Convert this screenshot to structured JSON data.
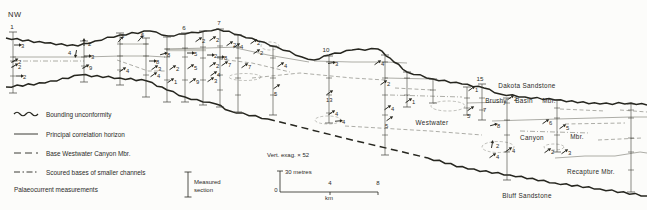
{
  "region_label": "NW",
  "colors": {
    "ink": "#26261f",
    "thin_line": "#6b6b62",
    "paper": "#fcfcfa"
  },
  "legend": {
    "items": [
      {
        "style": "wavy",
        "label": "Bounding unconformity"
      },
      {
        "style": "solid",
        "label": "Principal correlation horizon"
      },
      {
        "style": "dashed",
        "label": "Base Westwater Canyon Mbr."
      },
      {
        "style": "dashdot",
        "label": "Scoured bases of smaller channels"
      }
    ],
    "palaeocurrent_label": "Palaeocurrent measurements"
  },
  "scalebar": {
    "vert_exag": "Vert. exag. × 52",
    "vertical_label": "30 metres",
    "ticks": [
      "0",
      "4",
      "8"
    ],
    "unit": "km",
    "measured_section_line1": "Measured",
    "measured_section_line2": "section"
  },
  "strat_labels": [
    {
      "text": "Dakota Sandstone",
      "x": 527,
      "y": 88
    },
    {
      "text": "Brushy",
      "x": 496,
      "y": 103
    },
    {
      "text": "Basin",
      "x": 524,
      "y": 103
    },
    {
      "text": "Mbr.",
      "x": 549,
      "y": 103
    },
    {
      "text": "Westwater",
      "x": 432,
      "y": 125
    },
    {
      "text": "Canyon",
      "x": 532,
      "y": 140
    },
    {
      "text": "Mbr.",
      "x": 577,
      "y": 139
    },
    {
      "text": "Recapture Mbr.",
      "x": 591,
      "y": 174
    },
    {
      "text": "Bluff Sandstone",
      "x": 527,
      "y": 198
    }
  ],
  "section_numbers": [
    {
      "n": "1",
      "x": 12,
      "y": 29
    },
    {
      "n": "6",
      "x": 184,
      "y": 30
    },
    {
      "n": "7",
      "x": 219,
      "y": 25
    },
    {
      "n": "10",
      "x": 326,
      "y": 52
    },
    {
      "n": "15",
      "x": 480,
      "y": 81
    }
  ],
  "sections": [
    [
      13,
      32,
      93,
      [
        57,
        61,
        76
      ]
    ],
    [
      84,
      41,
      82,
      [
        57,
        66
      ]
    ],
    [
      120,
      33,
      85,
      [
        44,
        56,
        70
      ]
    ],
    [
      146,
      38,
      97,
      [
        44,
        56,
        75
      ]
    ],
    [
      167,
      37,
      102,
      [
        49,
        57,
        80
      ]
    ],
    [
      185,
      33,
      102,
      [
        48,
        57,
        80
      ]
    ],
    [
      203,
      31,
      105,
      [
        47,
        58,
        80
      ]
    ],
    [
      220,
      29,
      107,
      [
        46,
        58,
        75,
        90
      ]
    ],
    [
      238,
      35,
      112,
      [
        47,
        58,
        78,
        95
      ]
    ],
    [
      273,
      46,
      115,
      [
        58,
        78,
        95
      ]
    ],
    [
      329,
      56,
      123,
      [
        62,
        78,
        95,
        113
      ]
    ],
    [
      385,
      55,
      155,
      [
        62,
        78,
        95,
        115,
        135
      ]
    ],
    [
      407,
      72,
      107,
      [
        78,
        95
      ]
    ],
    [
      433,
      79,
      103,
      [
        90
      ]
    ],
    [
      467,
      87,
      115,
      [
        98,
        108
      ]
    ],
    [
      482,
      84,
      120,
      [
        98,
        110
      ]
    ],
    [
      507,
      98,
      180,
      [
        103,
        120,
        135,
        152
      ]
    ],
    [
      557,
      100,
      152,
      [
        108,
        118,
        135
      ]
    ],
    [
      631,
      104,
      192,
      [
        110,
        118,
        138,
        152,
        170
      ]
    ]
  ],
  "palaeocurrents": [
    {
      "x": 17,
      "y": 45,
      "v": "3",
      "a": 0
    },
    {
      "x": 14,
      "y": 61,
      "v": "2",
      "a": -30
    },
    {
      "x": 14,
      "y": 66,
      "v": "2",
      "a": -30
    },
    {
      "x": 19,
      "y": 76,
      "v": "2",
      "a": 0
    },
    {
      "x": 84,
      "y": 43,
      "v": "2",
      "a": -90
    },
    {
      "x": 76,
      "y": 53,
      "v": "4",
      "a": 100,
      "lx": -8,
      "ly": 2
    },
    {
      "x": 87,
      "y": 56,
      "v": "3",
      "a": 0
    },
    {
      "x": 85,
      "y": 67,
      "v": "9",
      "a": -30
    },
    {
      "x": 120,
      "y": 40,
      "v": "5",
      "a": -50,
      "lx": 1,
      "ly": -2
    },
    {
      "x": 122,
      "y": 70,
      "v": "4",
      "a": -35
    },
    {
      "x": 140,
      "y": 39,
      "v": "6",
      "a": -50,
      "lx": 1,
      "ly": -2
    },
    {
      "x": 152,
      "y": 61,
      "v": "8",
      "a": 0
    },
    {
      "x": 154,
      "y": 68,
      "v": "3",
      "a": -35
    },
    {
      "x": 153,
      "y": 75,
      "v": "4",
      "a": -35
    },
    {
      "x": 163,
      "y": 54,
      "v": "8",
      "a": -15
    },
    {
      "x": 172,
      "y": 68,
      "v": "2",
      "a": -35
    },
    {
      "x": 170,
      "y": 81,
      "v": "1",
      "a": -35
    },
    {
      "x": 190,
      "y": 53,
      "v": "5",
      "a": 0
    },
    {
      "x": 190,
      "y": 67,
      "v": "5",
      "a": -35
    },
    {
      "x": 192,
      "y": 81,
      "v": "9",
      "a": -35
    },
    {
      "x": 198,
      "y": 40,
      "v": "2",
      "a": -35
    },
    {
      "x": 212,
      "y": 39,
      "v": "2",
      "a": -35
    },
    {
      "x": 229,
      "y": 44,
      "v": "2",
      "a": -35
    },
    {
      "x": 236,
      "y": 46,
      "v": "4",
      "a": -35
    },
    {
      "x": 210,
      "y": 55,
      "v": "2",
      "a": 0
    },
    {
      "x": 220,
      "y": 57,
      "v": "8",
      "a": 0
    },
    {
      "x": 212,
      "y": 65,
      "v": "2",
      "a": -35
    },
    {
      "x": 224,
      "y": 64,
      "v": "7",
      "a": -35
    },
    {
      "x": 244,
      "y": 66,
      "v": "7",
      "a": -35
    },
    {
      "x": 213,
      "y": 74,
      "v": "4",
      "a": -35
    },
    {
      "x": 210,
      "y": 80,
      "v": "3",
      "a": -35
    },
    {
      "x": 253,
      "y": 42,
      "v": "2",
      "a": -35
    },
    {
      "x": 256,
      "y": 52,
      "v": "2",
      "a": -35
    },
    {
      "x": 280,
      "y": 65,
      "v": "4",
      "a": -35
    },
    {
      "x": 276,
      "y": 87,
      "v": "5",
      "a": -35,
      "lx": -2,
      "ly": 9
    },
    {
      "x": 331,
      "y": 63,
      "v": "3",
      "a": -10
    },
    {
      "x": 329,
      "y": 93,
      "v": "13",
      "a": -35,
      "lx": -3,
      "ly": 9
    },
    {
      "x": 331,
      "y": 113,
      "v": "4",
      "a": -35
    },
    {
      "x": 338,
      "y": 121,
      "v": "4",
      "a": -5
    },
    {
      "x": 377,
      "y": 63,
      "v": "4",
      "a": -35
    },
    {
      "x": 383,
      "y": 83,
      "v": "2",
      "a": -35
    },
    {
      "x": 387,
      "y": 108,
      "v": "4",
      "a": -35
    },
    {
      "x": 389,
      "y": 119,
      "v": "5",
      "a": -35,
      "lx": -4,
      "ly": 9
    },
    {
      "x": 408,
      "y": 101,
      "v": "1",
      "a": -35
    },
    {
      "x": 471,
      "y": 89,
      "v": "1",
      "a": -35
    },
    {
      "x": 470,
      "y": 109,
      "v": "5",
      "a": -35,
      "lx": -3,
      "ly": 9
    },
    {
      "x": 483,
      "y": 110,
      "v": "7",
      "a": null,
      "lx": 0,
      "ly": 2
    },
    {
      "x": 510,
      "y": 98,
      "v": "2",
      "a": -35
    },
    {
      "x": 493,
      "y": 125,
      "v": "8",
      "a": -15
    },
    {
      "x": 492,
      "y": 145,
      "v": "2",
      "a": -80
    },
    {
      "x": 508,
      "y": 150,
      "v": "4",
      "a": -35
    },
    {
      "x": 492,
      "y": 156,
      "v": "4",
      "a": -35
    },
    {
      "x": 545,
      "y": 122,
      "v": "6",
      "a": -35
    },
    {
      "x": 562,
      "y": 127,
      "v": "5",
      "a": -35
    },
    {
      "x": 547,
      "y": 151,
      "v": "2",
      "a": -35
    },
    {
      "x": 564,
      "y": 152,
      "v": "3",
      "a": -35
    }
  ],
  "lines": {
    "bold_wavy": [
      [
        [
          6,
          38
        ],
        [
          45,
          43
        ],
        [
          78,
          46
        ],
        [
          95,
          41
        ],
        [
          120,
          35
        ],
        [
          150,
          31
        ],
        [
          168,
          36
        ],
        [
          185,
          34
        ],
        [
          205,
          31
        ],
        [
          218,
          29
        ],
        [
          240,
          35
        ],
        [
          258,
          41
        ],
        [
          277,
          47
        ],
        [
          302,
          57
        ],
        [
          314,
          60
        ],
        [
          329,
          55
        ],
        [
          352,
          50
        ],
        [
          378,
          49
        ],
        [
          390,
          58
        ],
        [
          407,
          72
        ],
        [
          433,
          79
        ],
        [
          462,
          84
        ],
        [
          484,
          88
        ],
        [
          500,
          94
        ],
        [
          525,
          97
        ],
        [
          555,
          100
        ],
        [
          600,
          104
        ],
        [
          631,
          103
        ],
        [
          647,
          105
        ]
      ],
      [
        [
          6,
          87
        ],
        [
          45,
          83
        ],
        [
          80,
          75
        ],
        [
          120,
          78
        ],
        [
          147,
          81
        ],
        [
          167,
          90
        ],
        [
          185,
          97
        ],
        [
          203,
          102
        ],
        [
          216,
          104
        ],
        [
          230,
          111
        ],
        [
          268,
          119
        ]
      ],
      [
        [
          428,
          158
        ],
        [
          468,
          169
        ],
        [
          510,
          175
        ],
        [
          555,
          183
        ],
        [
          600,
          189
        ],
        [
          647,
          196
        ]
      ]
    ],
    "bold_dashed": [
      [
        [
          268,
          119
        ],
        [
          348,
          139
        ],
        [
          428,
          158
        ]
      ]
    ],
    "thin_solid": [
      [
        [
          13,
          57
        ],
        [
          84,
          57
        ],
        [
          120,
          56
        ],
        [
          148,
          56
        ],
        [
          165,
          57
        ]
      ],
      [
        [
          120,
          44
        ],
        [
          148,
          44
        ]
      ],
      [
        [
          165,
          49
        ],
        [
          207,
          48
        ],
        [
          240,
          47
        ]
      ],
      [
        [
          236,
          48
        ],
        [
          268,
          55
        ],
        [
          309,
          62
        ]
      ],
      [
        [
          314,
          61
        ],
        [
          352,
          62
        ],
        [
          385,
          62
        ],
        [
          407,
          63
        ]
      ],
      [
        [
          385,
          78
        ],
        [
          433,
          79
        ]
      ],
      [
        [
          467,
          103
        ],
        [
          507,
          102
        ]
      ],
      [
        [
          492,
          121
        ],
        [
          557,
          119
        ],
        [
          631,
          117
        ],
        [
          647,
          117
        ]
      ],
      [
        [
          555,
          158
        ],
        [
          585,
          156
        ],
        [
          615,
          156
        ],
        [
          640,
          152
        ],
        [
          647,
          153
        ]
      ]
    ],
    "thin_dashed": [
      [
        [
          117,
          60
        ],
        [
          148,
          71
        ],
        [
          167,
          71
        ]
      ],
      [
        [
          219,
          59
        ],
        [
          252,
          63
        ],
        [
          290,
          72
        ]
      ],
      [
        [
          252,
          78
        ],
        [
          300,
          73
        ],
        [
          352,
          78
        ],
        [
          385,
          80
        ]
      ],
      [
        [
          395,
          88
        ],
        [
          432,
          90
        ]
      ],
      [
        [
          345,
          126
        ],
        [
          430,
          131
        ],
        [
          482,
          135
        ]
      ],
      [
        [
          560,
          109
        ],
        [
          605,
          111
        ]
      ],
      [
        [
          620,
          110
        ],
        [
          647,
          112
        ]
      ],
      [
        [
          565,
          124
        ],
        [
          625,
          123
        ]
      ],
      [
        [
          598,
          140
        ],
        [
          642,
          138
        ]
      ]
    ],
    "thin_dashdot": [
      [
        [
          13,
          61
        ],
        [
          84,
          61
        ]
      ],
      [
        [
          390,
          95
        ],
        [
          462,
          97
        ]
      ],
      [
        [
          520,
          131
        ],
        [
          590,
          133
        ]
      ]
    ],
    "grey_band": [
      [
        166,
        50
      ],
      [
        206,
        50
      ]
    ],
    "lenses": [
      [
        270,
        46,
        9,
        4
      ],
      [
        245,
        77,
        16,
        3.5
      ],
      [
        328,
        120,
        13,
        4
      ],
      [
        448,
        106,
        17,
        5
      ],
      [
        498,
        147,
        16,
        5.5
      ],
      [
        554,
        147,
        10,
        3
      ]
    ]
  }
}
